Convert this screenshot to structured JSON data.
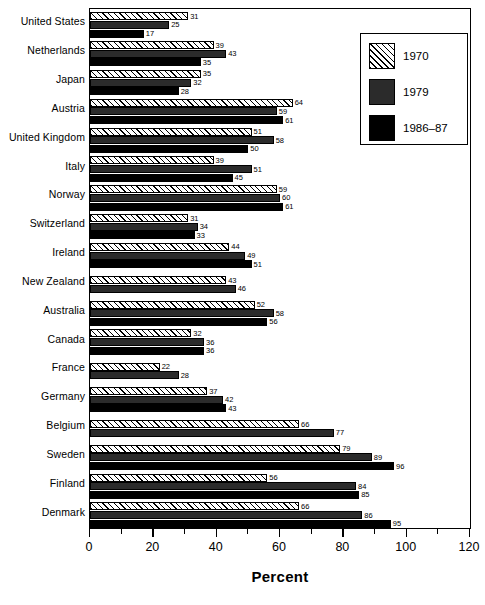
{
  "chart_data": {
    "type": "bar",
    "orientation": "horizontal",
    "title": "",
    "xlabel": "Percent",
    "ylabel": "",
    "xlim": [
      0,
      120
    ],
    "xticks": [
      0,
      20,
      40,
      60,
      80,
      100,
      120
    ],
    "xtick_labels": [
      "0",
      "20",
      "40",
      "60",
      "80",
      "100",
      "120"
    ],
    "minor_tick_step": 10,
    "grid": false,
    "legend_position": "top-right",
    "categories": [
      "United States",
      "Netherlands",
      "Japan",
      "Austria",
      "United Kingdom",
      "Italy",
      "Norway",
      "Switzerland",
      "Ireland",
      "New Zealand",
      "Australia",
      "Canada",
      "France",
      "Germany",
      "Belgium",
      "Sweden",
      "Finland",
      "Denmark"
    ],
    "series": [
      {
        "name": "1970",
        "color": "#ffffff",
        "pattern": "diagonal-hatch",
        "values": [
          31,
          39,
          35,
          64,
          51,
          39,
          59,
          31,
          44,
          43,
          52,
          32,
          22,
          37,
          66,
          79,
          56,
          66
        ]
      },
      {
        "name": "1979",
        "color": "#2b2b2b",
        "pattern": "solid",
        "values": [
          25,
          43,
          32,
          59,
          58,
          51,
          60,
          34,
          49,
          46,
          58,
          36,
          28,
          42,
          77,
          89,
          84,
          86
        ]
      },
      {
        "name": "1986-87",
        "color": "#000000",
        "pattern": "solid",
        "values": [
          17,
          35,
          28,
          61,
          50,
          45,
          61,
          33,
          51,
          null,
          56,
          36,
          null,
          43,
          null,
          96,
          85,
          95
        ]
      }
    ]
  },
  "legend": {
    "entries": [
      {
        "label": "1970"
      },
      {
        "label": "1979"
      },
      {
        "label": "1986–87"
      }
    ]
  },
  "axis": {
    "x_title": "Percent",
    "x_labels": [
      "0",
      "20",
      "40",
      "60",
      "80",
      "100",
      "120"
    ]
  }
}
